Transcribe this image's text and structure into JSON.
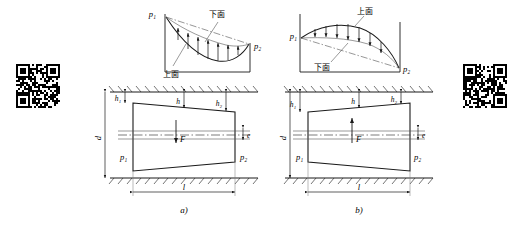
{
  "figure": {
    "title_a": "a)",
    "title_b": "b)"
  },
  "panel_a": {
    "caption": "a)",
    "pressure_plot": {
      "label_left": "p₁",
      "label_right": "p₂",
      "curve_label_top": "下面",
      "curve_label_bottom": "上面",
      "curve_direction": "downward-bulge",
      "arrow_count": 8,
      "arrow_direction": "up"
    },
    "section": {
      "label_h1": "h₁",
      "label_h": "h",
      "label_h2": "h₂",
      "label_d": "d",
      "label_e": "e",
      "label_l": "l",
      "label_F": "F",
      "label_p1": "p₁",
      "label_p2": "p₂",
      "force_direction": "down",
      "wedge_shape": "wide-left-narrow-right"
    }
  },
  "panel_b": {
    "caption": "b)",
    "pressure_plot": {
      "label_left": "p₁",
      "label_right": "p₂",
      "curve_label_top": "上面",
      "curve_label_bottom": "下面",
      "curve_direction": "upward-bulge",
      "arrow_count": 7,
      "arrow_direction": "down"
    },
    "section": {
      "label_h1": "h₁",
      "label_h": "h",
      "label_h2": "h₂",
      "label_d": "d",
      "label_e": "e",
      "label_l": "l",
      "label_F": "F",
      "label_p1": "p₁",
      "label_p2": "p₂",
      "force_direction": "up",
      "wedge_shape": "narrow-left-wide-right"
    }
  },
  "decorations": {
    "qr_left_name": "qr-code-left",
    "qr_right_name": "qr-code-right"
  },
  "colors": {
    "line": "#1a1a1a",
    "thin": "#4a4a4a",
    "centerline": "#555555",
    "background": "#ffffff"
  }
}
